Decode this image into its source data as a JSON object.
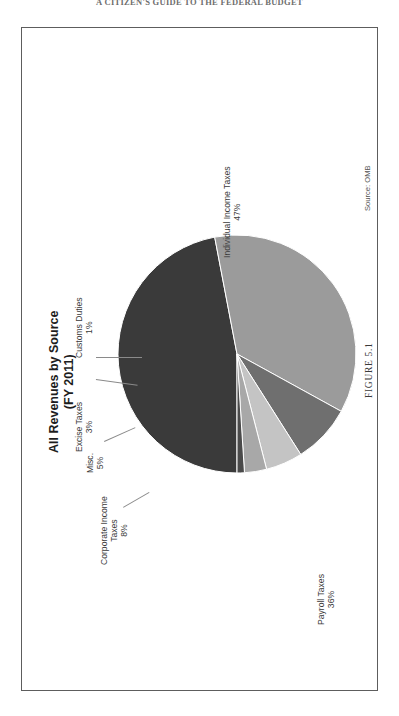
{
  "page": {
    "running_head": "A CITIZEN'S GUIDE TO THE FEDERAL BUDGET",
    "figure_caption": "FIGURE 5.1"
  },
  "figure": {
    "source_note": "Source: OMB"
  },
  "chart_data": {
    "type": "pie",
    "title": "All Revenues by Source",
    "subtitle": "(FY 2011)",
    "xlabel": "",
    "ylabel": "",
    "legend_position": "none",
    "grid": false,
    "units": "percent",
    "categories": [
      "Individual Income Taxes",
      "Payroll Taxes",
      "Corporate Income Taxes",
      "Misc.",
      "Excise Taxes",
      "Customs Duties"
    ],
    "values": [
      47,
      36,
      8,
      5,
      3,
      1
    ],
    "colors": [
      "#3a3a3a",
      "#9b9b9b",
      "#6f6f6f",
      "#c4c4c4",
      "#a8a8a8",
      "#4a4a4a"
    ],
    "labels": [
      {
        "name": "Individual Income Taxes",
        "value": 47,
        "text": "Individual Income Taxes",
        "pct": "47%"
      },
      {
        "name": "Payroll Taxes",
        "value": 36,
        "text": "Payroll Taxes",
        "pct": "36%"
      },
      {
        "name": "Corporate Income Taxes",
        "value": 8,
        "text": "Corporate Income\nTaxes",
        "pct": "8%"
      },
      {
        "name": "Misc.",
        "value": 5,
        "text": "Misc.",
        "pct": "5%"
      },
      {
        "name": "Excise Taxes",
        "value": 3,
        "text": "Excise Taxes",
        "pct": "3%"
      },
      {
        "name": "Customs Duties",
        "value": 1,
        "text": "Customs Duties",
        "pct": "1%"
      }
    ],
    "label_text": {
      "individual_l1": "Individual Income Taxes",
      "individual_l2": "47%",
      "payroll_l1": "Payroll Taxes",
      "payroll_l2": "36%",
      "corporate_l1": "Corporate Income",
      "corporate_l2": "Taxes",
      "corporate_l3": "8%",
      "misc_l1": "Misc.",
      "misc_l2": "5%",
      "excise_l1": "Excise Taxes",
      "excise_l2": "3%",
      "customs_l1": "Customs Duties",
      "customs_l2": "1%"
    }
  }
}
